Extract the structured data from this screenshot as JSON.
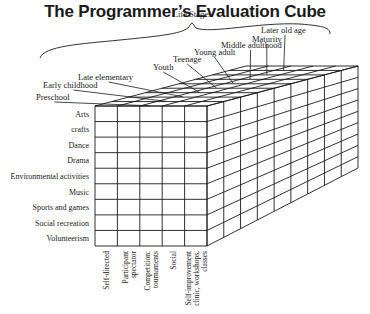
{
  "title": "The Programmer’s Evaluation Cube",
  "diagram": {
    "axis_top_label": "Life Stages",
    "life_stages": [
      "Preschool",
      "Early childhood",
      "Late elementary",
      "Youth",
      "Teenage",
      "Young adult",
      "Middle adulthood",
      "Maturity",
      "Later old age"
    ],
    "activity_rows": [
      "Arts",
      "crafts",
      "Dance",
      "Drama",
      "Environmental activities",
      "Music",
      "Sports and games",
      "Social recreation",
      "Volunteerism"
    ],
    "format_columns": [
      [
        "Self-directed"
      ],
      [
        "Participant",
        "spectator"
      ],
      [
        "Competition:",
        "tournaments"
      ],
      [
        "Social"
      ],
      [
        "Self-improvement",
        "clinic, workshops,",
        "classes"
      ]
    ],
    "colors": {
      "line": "#1a1a1a",
      "background": "#ffffff"
    }
  }
}
